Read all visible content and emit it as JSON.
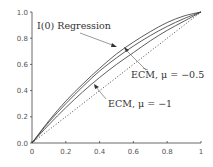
{
  "chart_data": {
    "type": "line",
    "title": "",
    "xlabel": "",
    "ylabel": "",
    "xlim": [
      0,
      1
    ],
    "ylim": [
      0,
      1
    ],
    "grid": false,
    "x_ticks": [
      "0",
      "0.2",
      "0.4",
      "0.6",
      "0.8",
      "1"
    ],
    "y_ticks": [
      "0.0",
      "0.2",
      "0.4",
      "0.6",
      "0.8",
      "1.0"
    ],
    "x": [
      0,
      0.1,
      0.2,
      0.3,
      0.4,
      0.5,
      0.6,
      0.7,
      0.8,
      0.9,
      1.0
    ],
    "series": [
      {
        "name": "I(0) Regression",
        "style": "solid",
        "values": [
          0,
          0.17,
          0.32,
          0.45,
          0.57,
          0.68,
          0.77,
          0.85,
          0.92,
          0.97,
          1.0
        ]
      },
      {
        "name": "ECM, μ = −0.5",
        "style": "solid",
        "values": [
          0,
          0.16,
          0.3,
          0.43,
          0.55,
          0.65,
          0.74,
          0.82,
          0.89,
          0.95,
          1.0
        ]
      },
      {
        "name": "ECM, μ = −1",
        "style": "solid",
        "values": [
          0,
          0.14,
          0.27,
          0.39,
          0.5,
          0.6,
          0.69,
          0.78,
          0.86,
          0.93,
          1.0
        ]
      },
      {
        "name": "45-degree line",
        "style": "dotted",
        "values": [
          0,
          0.1,
          0.2,
          0.3,
          0.4,
          0.5,
          0.6,
          0.7,
          0.8,
          0.9,
          1.0
        ]
      }
    ],
    "annotations": [
      {
        "text": "I(0) Regression",
        "arrow_to": [
          0.6,
          0.8
        ]
      },
      {
        "text": "ECM, μ = −0.5",
        "arrow_to": [
          0.57,
          0.71
        ]
      },
      {
        "text": "ECM, μ = −1",
        "arrow_to": [
          0.38,
          0.46
        ]
      }
    ]
  }
}
